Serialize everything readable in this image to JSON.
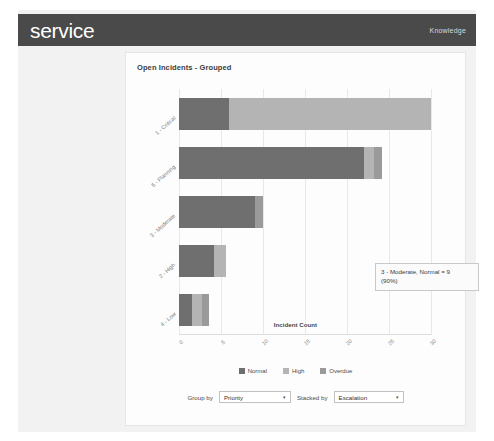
{
  "header": {
    "logo": "service",
    "nav_link": "Knowledge"
  },
  "card": {
    "title": "Open Incidents - Grouped"
  },
  "tooltip": {
    "line1": "3 - Moderate, Normal = 9",
    "line2": "(90%)"
  },
  "legend": [
    {
      "label": "Normal",
      "color": "#6f6f6f"
    },
    {
      "label": "High",
      "color": "#b4b4b4"
    },
    {
      "label": "Overdue",
      "color": "#9a9a9a"
    }
  ],
  "controls": {
    "group_by_label": "Group by",
    "group_by_value": "Priority",
    "stacked_by_label": "Stacked by",
    "stacked_by_value": "Escalation",
    "caret": "▾"
  },
  "chart_data": {
    "type": "bar",
    "orientation": "horizontal",
    "stacked": true,
    "title": "Open Incidents - Grouped",
    "xlabel": "Incident Count",
    "ylabel": "",
    "xlim": [
      0,
      30
    ],
    "xticks": [
      0,
      5,
      10,
      15,
      20,
      25,
      30
    ],
    "xticklabels": [
      "0",
      "5",
      "10",
      "15",
      "20",
      "25",
      "30"
    ],
    "grid": "vertical",
    "legend_position": "bottom",
    "categories": [
      "1 - Critical",
      "5 - Planning",
      "3 - Moderate",
      "2 - High",
      "4 - Low"
    ],
    "series": [
      {
        "name": "Normal",
        "color": "#6f6f6f",
        "values": [
          6.0,
          22.0,
          9.0,
          4.2,
          1.6
        ]
      },
      {
        "name": "High",
        "color": "#b4b4b4",
        "values": [
          24.0,
          1.2,
          0.0,
          1.4,
          1.1
        ]
      },
      {
        "name": "Overdue",
        "color": "#9a9a9a",
        "values": [
          0.0,
          1.0,
          1.0,
          0.0,
          0.9
        ]
      }
    ]
  }
}
